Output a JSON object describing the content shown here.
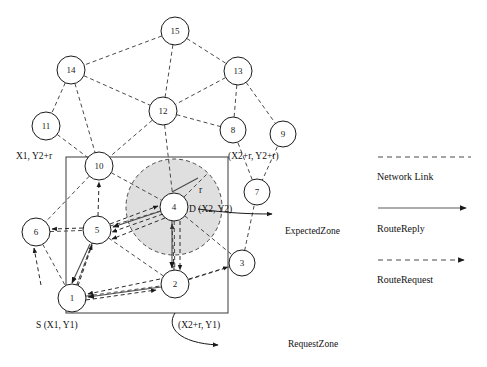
{
  "figure": {
    "colors": {
      "node_fill": "#ffffff",
      "stroke": "#1a1a1a",
      "expected_zone_fill": "#d9d9d9",
      "link": "#4a4a4a"
    }
  },
  "nodes": [
    {
      "id": "15",
      "label": "15",
      "x": 175,
      "y": 31,
      "r": 14
    },
    {
      "id": "14",
      "label": "14",
      "x": 71,
      "y": 70,
      "r": 14
    },
    {
      "id": "13",
      "label": "13",
      "x": 238,
      "y": 71,
      "r": 14
    },
    {
      "id": "12",
      "label": "12",
      "x": 163,
      "y": 111,
      "r": 14
    },
    {
      "id": "11",
      "label": "11",
      "x": 46,
      "y": 126,
      "r": 14
    },
    {
      "id": "8",
      "label": "8",
      "x": 233,
      "y": 130,
      "r": 13
    },
    {
      "id": "9",
      "label": "9",
      "x": 283,
      "y": 134,
      "r": 13
    },
    {
      "id": "10",
      "label": "10",
      "x": 99,
      "y": 166,
      "r": 14
    },
    {
      "id": "7",
      "label": "7",
      "x": 257,
      "y": 192,
      "r": 13
    },
    {
      "id": "4",
      "label": "4",
      "x": 174,
      "y": 207,
      "r": 14
    },
    {
      "id": "6",
      "label": "6",
      "x": 36,
      "y": 232,
      "r": 14
    },
    {
      "id": "5",
      "label": "5",
      "x": 97,
      "y": 230,
      "r": 14
    },
    {
      "id": "3",
      "label": "3",
      "x": 242,
      "y": 263,
      "r": 13
    },
    {
      "id": "2",
      "label": "2",
      "x": 175,
      "y": 284,
      "r": 14
    },
    {
      "id": "1",
      "label": "1",
      "x": 72,
      "y": 298,
      "r": 14
    }
  ],
  "network_links": [
    [
      "15",
      "14"
    ],
    [
      "15",
      "13"
    ],
    [
      "15",
      "12"
    ],
    [
      "14",
      "12"
    ],
    [
      "14",
      "11"
    ],
    [
      "14",
      "10"
    ],
    [
      "13",
      "12"
    ],
    [
      "13",
      "8"
    ],
    [
      "13",
      "9"
    ],
    [
      "12",
      "10"
    ],
    [
      "12",
      "8"
    ],
    [
      "12",
      "4"
    ],
    [
      "11",
      "10"
    ],
    [
      "8",
      "7"
    ],
    [
      "9",
      "7"
    ],
    [
      "10",
      "5"
    ],
    [
      "10",
      "4"
    ],
    [
      "10",
      "6"
    ],
    [
      "7",
      "3"
    ],
    [
      "4",
      "5"
    ],
    [
      "4",
      "2"
    ],
    [
      "4",
      "3"
    ],
    [
      "6",
      "5"
    ],
    [
      "6",
      "1"
    ],
    [
      "5",
      "1"
    ],
    [
      "5",
      "2"
    ],
    [
      "1",
      "2"
    ],
    [
      "2",
      "3"
    ]
  ],
  "route_request_links": [
    [
      "1",
      "5"
    ],
    [
      "1",
      "2"
    ],
    [
      "5",
      "6"
    ],
    [
      "5",
      "10"
    ],
    [
      "5",
      "4"
    ],
    [
      "2",
      "4"
    ],
    [
      "2",
      "3"
    ],
    [
      "4",
      "2"
    ]
  ],
  "route_reply_links": [
    [
      "4",
      "5"
    ],
    [
      "5",
      "1"
    ],
    [
      "2",
      "1"
    ],
    [
      "4",
      "2"
    ]
  ],
  "zone_box": {
    "x": 66,
    "y": 157,
    "width": 162,
    "height": 156,
    "corner_labels": {
      "top_left": "X1, Y2+r",
      "top_right": "(X2+r, Y2+r)",
      "bottom_left": "S (X1, Y1)",
      "bottom_right": "(X2+r, Y1)"
    }
  },
  "expected_zone": {
    "center_x": 174,
    "center_y": 207,
    "radius": 48,
    "radius_label": "r",
    "destination_label": "D (X2, Y2)",
    "callout_label": "ExpectedZone"
  },
  "request_zone": {
    "callout_label": "RequestZone"
  },
  "legend": {
    "items": [
      {
        "key": "network-link",
        "label": "Network Link",
        "style": "dashed",
        "arrow": false
      },
      {
        "key": "route-reply",
        "label": "RouteReply",
        "style": "solid",
        "arrow": true
      },
      {
        "key": "route-request",
        "label": "RouteRequest",
        "style": "dashed-arrow",
        "arrow": true
      }
    ]
  }
}
